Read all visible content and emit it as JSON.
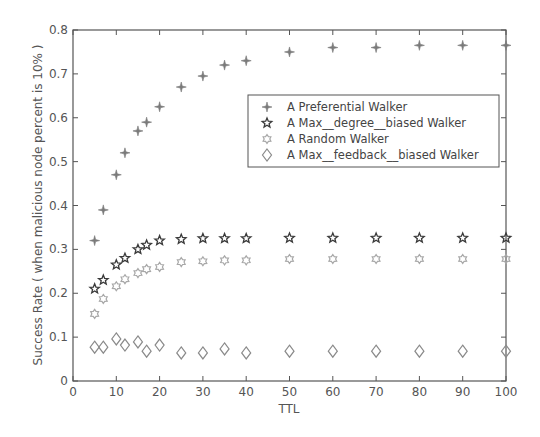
{
  "chart_data": {
    "type": "scatter",
    "title": "",
    "xlabel": "TTL",
    "ylabel": "Success Rate ( when malicious node percent is 10% )",
    "xlim": [
      0,
      100
    ],
    "ylim": [
      0,
      0.8
    ],
    "xticks": [
      0,
      10,
      20,
      30,
      40,
      50,
      60,
      70,
      80,
      90,
      100
    ],
    "yticks": [
      0,
      0.1,
      0.2,
      0.3,
      0.4,
      0.5,
      0.6,
      0.7,
      0.8
    ],
    "xtick_labels": [
      "0",
      "10",
      "20",
      "30",
      "40",
      "50",
      "60",
      "70",
      "80",
      "90",
      "100"
    ],
    "ytick_labels": [
      "0",
      "0.1",
      "0.2",
      "0.3",
      "0.4",
      "0.5",
      "0.6",
      "0.7",
      "0.8"
    ],
    "grid": false,
    "legend_position": "upper right (inside, below top)",
    "x": [
      5,
      7,
      10,
      12,
      15,
      17,
      20,
      25,
      30,
      35,
      40,
      50,
      60,
      70,
      80,
      90,
      100
    ],
    "series": [
      {
        "name": "A Preferential Walker",
        "marker": "four-point-star",
        "color": "#7a7a7a",
        "values": [
          0.32,
          0.39,
          0.47,
          0.52,
          0.57,
          0.59,
          0.625,
          0.67,
          0.695,
          0.72,
          0.73,
          0.75,
          0.76,
          0.76,
          0.765,
          0.765,
          0.765
        ]
      },
      {
        "name": "A Max__degree__biased Walker",
        "marker": "pentagram",
        "color": "#3a3a3a",
        "values": [
          0.21,
          0.23,
          0.265,
          0.28,
          0.3,
          0.31,
          0.32,
          0.323,
          0.325,
          0.325,
          0.325,
          0.326,
          0.326,
          0.326,
          0.326,
          0.326,
          0.326
        ]
      },
      {
        "name": "A Random Walker",
        "marker": "hexagram",
        "color": "#a8a8a8",
        "values": [
          0.153,
          0.187,
          0.216,
          0.232,
          0.246,
          0.255,
          0.26,
          0.271,
          0.273,
          0.275,
          0.275,
          0.278,
          0.278,
          0.278,
          0.278,
          0.278,
          0.278
        ]
      },
      {
        "name": "A Max__feedback__biased Walker",
        "marker": "diamond",
        "color": "#8a8a8a",
        "values": [
          0.077,
          0.077,
          0.096,
          0.082,
          0.089,
          0.068,
          0.082,
          0.064,
          0.064,
          0.073,
          0.064,
          0.068,
          0.068,
          0.068,
          0.068,
          0.068,
          0.068
        ]
      }
    ]
  },
  "colors": {
    "axis": "#555555",
    "background": "#ffffff"
  }
}
